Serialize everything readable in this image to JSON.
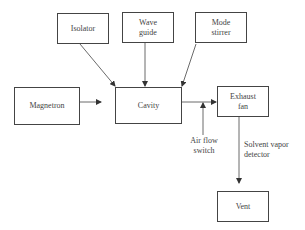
{
  "diagram": {
    "nodes": {
      "isolator": {
        "label": "Isolator"
      },
      "wave_guide": {
        "label": "Wave guide",
        "line1": "Wave",
        "line2": "guide"
      },
      "mode_stirrer": {
        "label": "Mode stirrer",
        "line1": "Mode",
        "line2": "stirrer"
      },
      "magnetron": {
        "label": "Magnetron"
      },
      "cavity": {
        "label": "Cavity"
      },
      "exhaust_fan": {
        "label": "Exhaust fan",
        "line1": "Exhaust",
        "line2": "fan"
      },
      "vent": {
        "label": "Vent"
      }
    },
    "annotations": {
      "air_flow_switch": {
        "line1": "Air flow",
        "line2": "switch"
      },
      "solvent_vapor_detector": {
        "line1": "Solvent vapor",
        "line2": "detector"
      }
    },
    "edges": [
      {
        "from": "isolator",
        "to": "cavity"
      },
      {
        "from": "wave_guide",
        "to": "cavity"
      },
      {
        "from": "mode_stirrer",
        "to": "cavity"
      },
      {
        "from": "magnetron",
        "to": "cavity"
      },
      {
        "from": "cavity",
        "to": "exhaust_fan"
      },
      {
        "from": "air_flow_switch",
        "to": "cavity-exhaust_fan-line"
      },
      {
        "from": "exhaust_fan",
        "to": "vent"
      }
    ],
    "colors": {
      "line": "#444444",
      "background": "#ffffff"
    }
  }
}
